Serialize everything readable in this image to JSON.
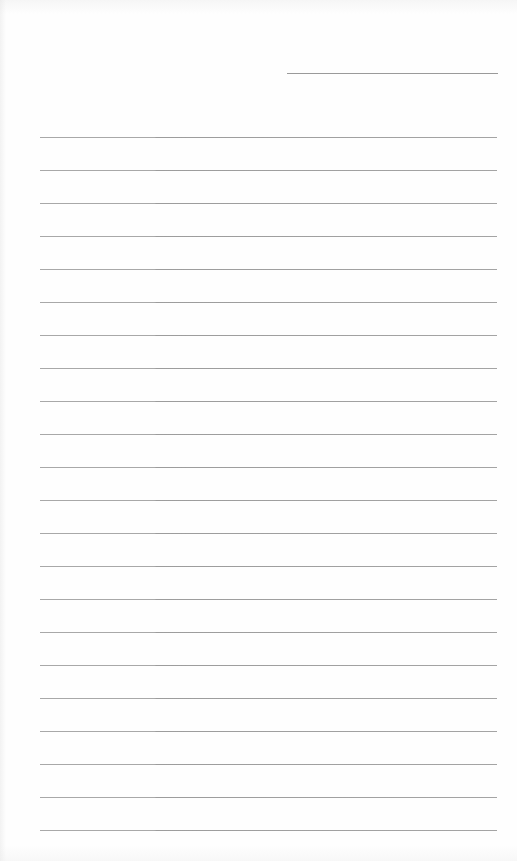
{
  "document": {
    "type": "lined-paper",
    "background": "#fefefe",
    "line_color": "#a4a4a4",
    "header_line": {
      "left": 287,
      "top": 73,
      "width": 211
    },
    "rules": {
      "left": 40,
      "width": 457,
      "first_top": 137,
      "spacing": 33,
      "count": 22
    }
  }
}
